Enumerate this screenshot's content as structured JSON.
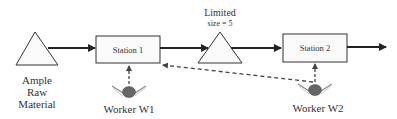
{
  "diagram": {
    "source": {
      "label_lines": [
        "Ample",
        "Raw",
        "Material"
      ]
    },
    "stations": [
      {
        "label": "Station 1"
      },
      {
        "label": "Station 2"
      }
    ],
    "buffer": {
      "title": "Limited",
      "size_label": "size = 5"
    },
    "workers": [
      {
        "label": "Worker W1"
      },
      {
        "label": "Worker W2"
      }
    ],
    "colors": {
      "stroke": "#222222",
      "dashed": "#444444",
      "worker_head": "#666666"
    }
  }
}
